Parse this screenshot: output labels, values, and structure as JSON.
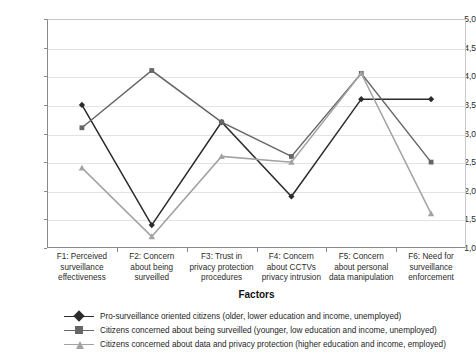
{
  "chart_data": {
    "type": "line",
    "title": "",
    "xlabel": "Factors",
    "ylabel": "Mean values",
    "ylim": [
      1.0,
      5.0
    ],
    "ytick_step": 0.5,
    "grid": true,
    "legend_position": "bottom",
    "decimal_separator": ",",
    "yticks": [
      "5,0",
      "4,5",
      "4,0",
      "3,5",
      "3,0",
      "2,5",
      "2,0",
      "1,5",
      "1,0"
    ],
    "ytick_values": [
      5.0,
      4.5,
      4.0,
      3.5,
      3.0,
      2.5,
      2.0,
      1.5,
      1.0
    ],
    "categories": [
      "F1: Perceived surveillance effectiveness",
      "F2: Concern about being surveilled",
      "F3: Trust in privacy protection procedures",
      "F4: Concern about CCTVs privacy intrusion",
      "F5: Concern about personal data manipulation",
      "F6: Need for surveillance enforcement"
    ],
    "category_lines": [
      [
        "F1: Perceived",
        "surveillance",
        "effectiveness"
      ],
      [
        "F2: Concern",
        "about being",
        "surveilled"
      ],
      [
        "F3: Trust in",
        "privacy protection",
        "procedures"
      ],
      [
        "F4: Concern",
        "about CCTVs",
        "privacy intrusion"
      ],
      [
        "F5: Concern",
        "about personal",
        "data manipulation"
      ],
      [
        "F6: Need for",
        "surveillance",
        "enforcement"
      ]
    ],
    "series": [
      {
        "name": "Pro-surveillance oriented citizens (older, lower education and income, unemployed)",
        "values": [
          3.5,
          1.4,
          3.2,
          1.9,
          3.6,
          3.6
        ],
        "color": "#2b2b2b",
        "marker": "diamond"
      },
      {
        "name": "Citizens concerned about being surveilled (younger, low education and income, unemployed)",
        "values": [
          3.1,
          4.1,
          3.2,
          2.6,
          4.05,
          2.5
        ],
        "color": "#666666",
        "marker": "square"
      },
      {
        "name": "Citizens concerned about data and privacy protection (higher education and income, employed)",
        "values": [
          2.4,
          1.2,
          2.6,
          2.5,
          4.05,
          1.6
        ],
        "color": "#a3a3a3",
        "marker": "triangle"
      }
    ]
  }
}
